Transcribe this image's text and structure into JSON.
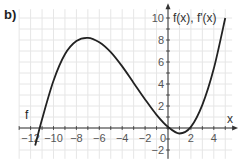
{
  "panel_label": "b)",
  "chart_data": {
    "type": "line",
    "title": "",
    "xlabel": "x",
    "ylabel": "f(x), f'(x)",
    "xlim": [
      -13,
      5.6
    ],
    "ylim": [
      -2.8,
      10.8
    ],
    "grid": true,
    "x_ticks": [
      -12,
      -10,
      -8,
      -6,
      -4,
      -2,
      0,
      2,
      4
    ],
    "x_tick_labels": [
      "−12",
      "−10",
      "−8",
      "−6",
      "−4",
      "−2",
      "0",
      "2",
      "4"
    ],
    "y_ticks": [
      -2,
      2,
      4,
      6,
      8,
      10
    ],
    "y_tick_labels": [
      "−2",
      "2",
      "4",
      "6",
      "8",
      "10"
    ],
    "series": [
      {
        "name": "f",
        "label": "f",
        "color": "#222222",
        "key_points": [
          {
            "x": -11.6,
            "y": -1.6,
            "note": "lower-left end"
          },
          {
            "x": -11.2,
            "y": 0,
            "note": "zero"
          },
          {
            "x": -7,
            "y": 8.2,
            "note": "local maximum"
          },
          {
            "x": 1,
            "y": -0.5,
            "note": "local minimum"
          },
          {
            "x": 5,
            "y": 10,
            "note": "upper-right end"
          }
        ],
        "x": [
          -11.6,
          -11,
          -10,
          -9,
          -8,
          -7,
          -6,
          -5,
          -4,
          -3,
          -2,
          -1,
          0,
          1,
          2,
          3,
          4,
          5
        ],
        "y": [
          -1.6,
          0.8,
          4.3,
          6.7,
          7.9,
          8.2,
          7.8,
          6.9,
          5.6,
          4.1,
          2.6,
          1.2,
          0.1,
          -0.5,
          0.1,
          2.1,
          5.4,
          10.0
        ]
      }
    ]
  },
  "colors": {
    "grid": "#e6e6e6",
    "axis": "#333333",
    "curve": "#222222",
    "text": "#555555"
  }
}
